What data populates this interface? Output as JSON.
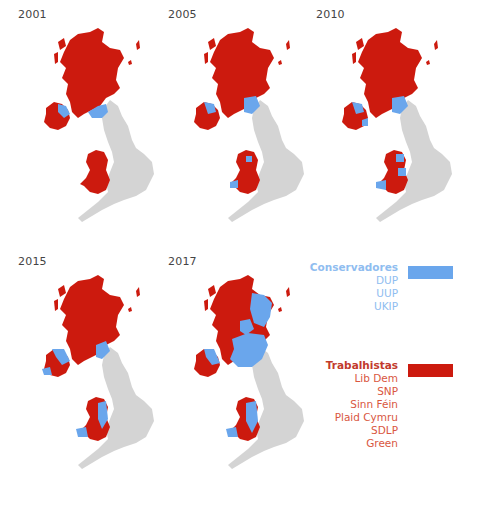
{
  "colors": {
    "conservative": "#6aa6ec",
    "labour": "#cc1a0e",
    "other": "#d4d4d4",
    "conservative_text": "#8fbdf0",
    "labour_text": "#d9573f",
    "labour_head": "#c23a2c"
  },
  "panels": [
    {
      "year": "2001",
      "wales": "labour-dominant",
      "ni": "mostly-labour-group",
      "border": "conservative-small"
    },
    {
      "year": "2005",
      "wales": "labour-dominant",
      "ni": "mostly-labour-group",
      "border": "conservative-small"
    },
    {
      "year": "2010",
      "wales": "labour-with-conservative",
      "ni": "mostly-labour-group",
      "border": "conservative-small"
    },
    {
      "year": "2015",
      "wales": "mixed",
      "ni": "mixed",
      "border": "conservative-small"
    },
    {
      "year": "2017",
      "wales": "mixed",
      "ni": "mixed",
      "border": "conservative-large"
    }
  ],
  "legend": {
    "conservative_group": {
      "head": "Conservadores",
      "items": [
        "DUP",
        "UUP",
        "UKIP"
      ]
    },
    "labour_group": {
      "head": "Trabalhistas",
      "items": [
        "Lib Dem",
        "SNP",
        "Sinn Féin",
        "Plaid Cymru",
        "SDLP",
        "Green"
      ]
    }
  }
}
